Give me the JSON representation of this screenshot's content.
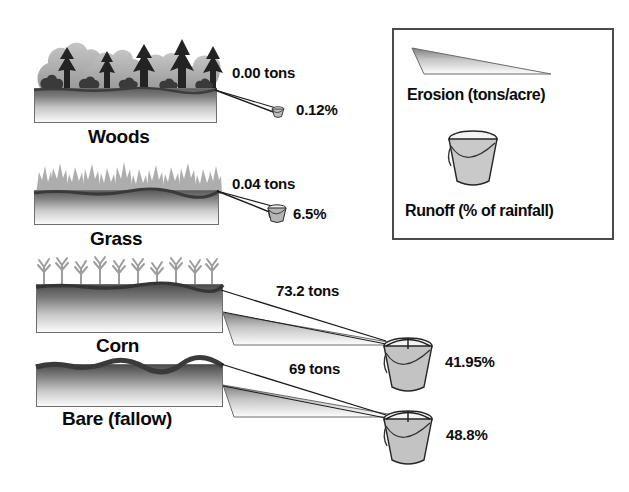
{
  "diagram": {
    "plots": [
      {
        "id": "woods",
        "name": "Woods",
        "erosion_label": "0.00 tons",
        "erosion_value": 0.0,
        "runoff_label": "0.12%",
        "runoff_value": 0.12,
        "cover": "trees"
      },
      {
        "id": "grass",
        "name": "Grass",
        "erosion_label": "0.04 tons",
        "erosion_value": 0.04,
        "runoff_label": "6.5%",
        "runoff_value": 6.5,
        "cover": "grass"
      },
      {
        "id": "corn",
        "name": "Corn",
        "erosion_label": "73.2 tons",
        "erosion_value": 73.2,
        "runoff_label": "41.95%",
        "runoff_value": 41.95,
        "cover": "corn"
      },
      {
        "id": "bare",
        "name": "Bare (fallow)",
        "erosion_label": "69 tons",
        "erosion_value": 69,
        "runoff_label": "48.8%",
        "runoff_value": 48.8,
        "cover": "bare"
      }
    ]
  },
  "legend": {
    "erosion_caption": "Erosion (tons/acre)",
    "runoff_caption": "Runoff (% of rainfall)",
    "erosion_icon": "wedge-icon",
    "runoff_icon": "bucket-icon"
  },
  "colors": {
    "soil_dark": "#5e5e5e",
    "soil_light": "#fcfcfc",
    "vegetation_light": "#b9b9b9",
    "vegetation_dark": "#2a2a2a",
    "outline": "#4a4a4a",
    "text": "#0a0a0a",
    "background": "#ffffff"
  }
}
